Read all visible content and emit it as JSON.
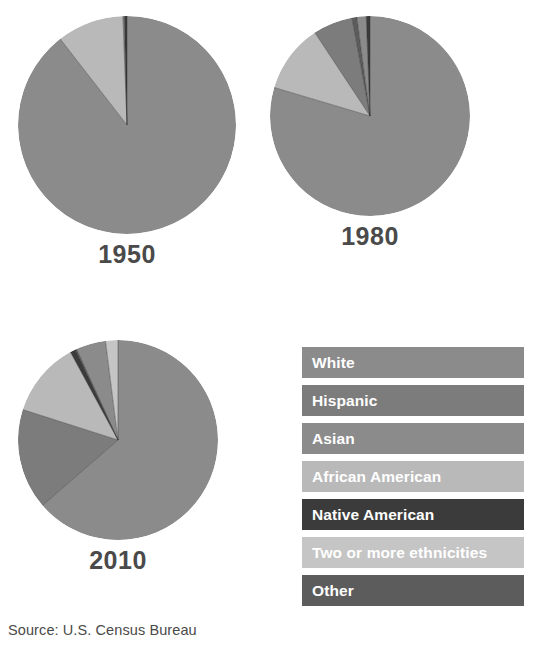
{
  "title": "",
  "source": "Source: U.S. Census Bureau",
  "legend": {
    "items": [
      {
        "label": "White",
        "color": "#8b8b8b"
      },
      {
        "label": "Hispanic",
        "color": "#7c7c7c"
      },
      {
        "label": "Asian",
        "color": "#8b8b8b"
      },
      {
        "label": "African American",
        "color": "#b9b9b9"
      },
      {
        "label": "Native American",
        "color": "#3b3b3b"
      },
      {
        "label": "Two or more ethnicities",
        "color": "#c5c5c5"
      },
      {
        "label": "Other",
        "color": "#5c5c5c"
      }
    ]
  },
  "chart_data": {
    "type": "pie",
    "title": "",
    "legend_position": "bottom-right",
    "categories": [
      "White",
      "Hispanic",
      "Asian",
      "African American",
      "Native American",
      "Two or more ethnicities",
      "Other"
    ],
    "colors": [
      "#8b8b8b",
      "#7c7c7c",
      "#8b8b8b",
      "#b9b9b9",
      "#3b3b3b",
      "#c5c5c5",
      "#5c5c5c"
    ],
    "charts": [
      {
        "label": "1950",
        "values": [
          89.5,
          0.0,
          0.2,
          9.9,
          0.4,
          0.0,
          0.0
        ],
        "slices": [
          {
            "name": "White",
            "percent": 89.5,
            "color": "#8b8b8b"
          },
          {
            "name": "African American",
            "percent": 9.9,
            "color": "#b9b9b9"
          },
          {
            "name": "Asian",
            "percent": 0.2,
            "color": "#8b8b8b"
          },
          {
            "name": "Native American",
            "percent": 0.4,
            "color": "#3b3b3b"
          }
        ]
      },
      {
        "label": "1980",
        "values": [
          79.6,
          6.4,
          1.5,
          11.1,
          0.6,
          0.0,
          0.8
        ],
        "slices": [
          {
            "name": "White",
            "percent": 79.6,
            "color": "#8b8b8b"
          },
          {
            "name": "African American",
            "percent": 11.1,
            "color": "#b9b9b9"
          },
          {
            "name": "Hispanic",
            "percent": 6.4,
            "color": "#7c7c7c"
          },
          {
            "name": "Other",
            "percent": 0.8,
            "color": "#5c5c5c"
          },
          {
            "name": "Asian",
            "percent": 1.5,
            "color": "#8b8b8b"
          },
          {
            "name": "Native American",
            "percent": 0.6,
            "color": "#3b3b3b"
          }
        ]
      },
      {
        "label": "2010",
        "values": [
          63.7,
          16.3,
          4.8,
          12.2,
          0.9,
          2.0,
          0.2
        ],
        "slices": [
          {
            "name": "White",
            "percent": 63.7,
            "color": "#8b8b8b"
          },
          {
            "name": "Hispanic",
            "percent": 16.3,
            "color": "#7c7c7c"
          },
          {
            "name": "African American",
            "percent": 12.2,
            "color": "#b9b9b9"
          },
          {
            "name": "Native American",
            "percent": 0.9,
            "color": "#3b3b3b"
          },
          {
            "name": "Other",
            "percent": 0.2,
            "color": "#5c5c5c"
          },
          {
            "name": "Asian",
            "percent": 4.8,
            "color": "#8b8b8b"
          },
          {
            "name": "Two or more ethnicities",
            "percent": 2.0,
            "color": "#c5c5c5"
          }
        ]
      }
    ]
  }
}
